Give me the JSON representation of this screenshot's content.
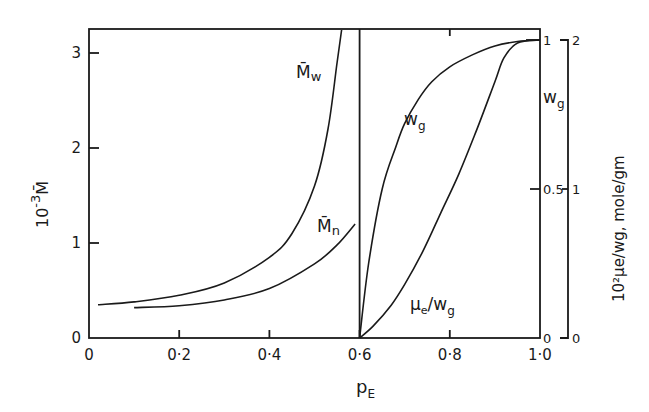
{
  "chart_data": {
    "type": "line",
    "title": "",
    "xlabel": "p_E",
    "ylabel_left": "10^-3 M̄",
    "ylabel_right_inner": "w_g",
    "ylabel_right_outer": "10^2 μe/wg, mole/gm",
    "xlim": [
      0,
      1.0
    ],
    "ylim_left": [
      0,
      3.25
    ],
    "ylim_right_inner": [
      0,
      1
    ],
    "ylim_right_outer": [
      0,
      2
    ],
    "x_ticks": [
      "0",
      "0·2",
      "0·4",
      "0·6",
      "0·8",
      "1·0"
    ],
    "x_tick_values": [
      0,
      0.2,
      0.4,
      0.6,
      0.8,
      1.0
    ],
    "y_left_ticks": [
      "0",
      "1",
      "2",
      "3"
    ],
    "y_left_tick_values": [
      0,
      1,
      2,
      3
    ],
    "y_right_inner_ticks": [
      "0",
      "0.5",
      "1"
    ],
    "y_right_inner_tick_values": [
      0,
      0.5,
      1
    ],
    "y_right_outer_ticks": [
      "0",
      "1",
      "2"
    ],
    "y_right_outer_tick_values": [
      0,
      1,
      2
    ],
    "grid": false,
    "vertical_line_x": 0.6,
    "series": [
      {
        "name": "M̄w",
        "axis": "left",
        "x": [
          0.02,
          0.1,
          0.2,
          0.3,
          0.4,
          0.45,
          0.5,
          0.53,
          0.55,
          0.56
        ],
        "y": [
          0.35,
          0.38,
          0.45,
          0.58,
          0.85,
          1.1,
          1.6,
          2.2,
          2.9,
          3.25
        ]
      },
      {
        "name": "M̄n",
        "axis": "left",
        "x": [
          0.1,
          0.2,
          0.3,
          0.4,
          0.5,
          0.55,
          0.59
        ],
        "y": [
          0.32,
          0.34,
          0.4,
          0.52,
          0.78,
          0.98,
          1.2
        ]
      },
      {
        "name": "wg",
        "axis": "right_inner",
        "x": [
          0.6,
          0.62,
          0.65,
          0.68,
          0.7,
          0.73,
          0.76,
          0.8,
          0.85,
          0.9,
          0.95,
          1.0
        ],
        "y": [
          0.0,
          0.25,
          0.5,
          0.64,
          0.72,
          0.8,
          0.86,
          0.91,
          0.95,
          0.98,
          0.995,
          1.0
        ]
      },
      {
        "name": "μe/wg",
        "axis": "right_outer",
        "x": [
          0.6,
          0.63,
          0.67,
          0.7,
          0.74,
          0.78,
          0.82,
          0.86,
          0.9,
          0.92,
          0.95,
          1.0
        ],
        "y": [
          0.0,
          0.08,
          0.22,
          0.36,
          0.58,
          0.84,
          1.1,
          1.4,
          1.72,
          1.88,
          1.98,
          2.0
        ]
      }
    ],
    "annotations": [
      {
        "text": "M̄w",
        "near_series": "M̄w"
      },
      {
        "text": "M̄n",
        "near_series": "M̄n"
      },
      {
        "text": "wg",
        "near_series": "wg"
      },
      {
        "text": "μe/wg",
        "near_series": "μe/wg"
      },
      {
        "text": "wg",
        "position": "right axis label"
      }
    ]
  },
  "labels": {
    "xlabel_main": "p",
    "xlabel_sub": "E",
    "ylabel_left_base": "10",
    "ylabel_left_exp": "-3",
    "ylabel_left_sym": "M̄",
    "ylabel_right_outer": "10²μe/wg, mole/gm",
    "right_inner_label_main": "w",
    "right_inner_label_sub": "g",
    "ann_mw_main": "M̄",
    "ann_mw_sub": "w",
    "ann_mn_main": "M̄",
    "ann_mn_sub": "n",
    "ann_wg_main": "w",
    "ann_wg_sub": "g",
    "ann_mu_main": "μ",
    "ann_mu_sub": "e",
    "ann_mu_rest": "/w",
    "ann_mu_sub2": "g"
  }
}
